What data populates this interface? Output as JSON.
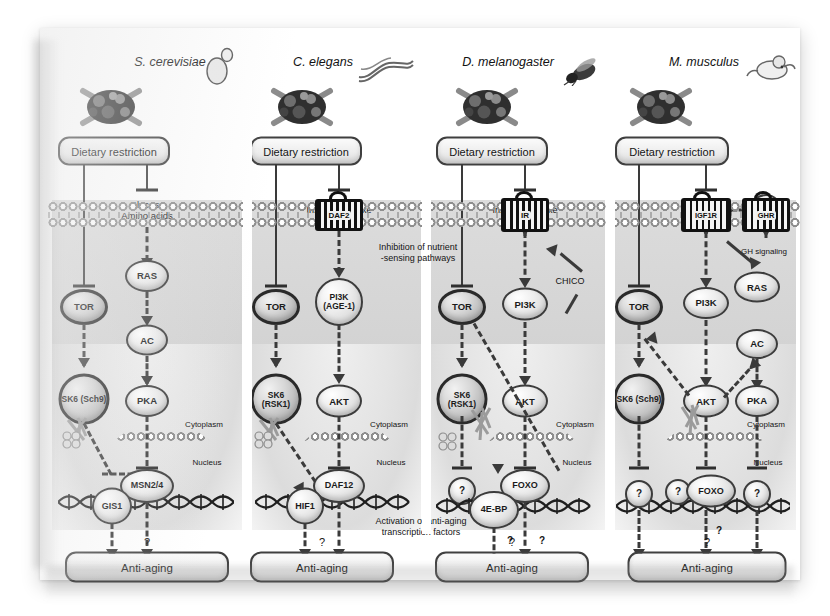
{
  "figure": {
    "cross_panel_annotations": {
      "inhibition_note": "Inhibition of nutrient\n-sensing pathways",
      "activation_note": "Activation of anti-aging\ntranscription factors"
    },
    "compartment_labels": {
      "cytoplasm": "Cytoplasm",
      "nucleus": "Nucleus"
    },
    "question_mark": "?",
    "colors": {
      "node_outline": "#3c3c3c",
      "dark_node_outline": "#2a2a2a",
      "connector": "#3a3a3a",
      "cell_background": "#d6d6d6",
      "paper": "#ffffff"
    }
  },
  "panels": [
    {
      "id": "s-cerevisiae",
      "species": "S. cerevisiae",
      "organism_icon": "yeast-cell-icon",
      "dietary_restriction": "Dietary restriction",
      "ligand_label": "Glucose\nAmino acids",
      "receptor": null,
      "nodes": [
        {
          "name": "TOR",
          "label": "TOR",
          "style": "dark"
        },
        {
          "name": "SK6",
          "label": "SK6\n(Sch9)",
          "style": "dark"
        },
        {
          "name": "RAS",
          "label": "RAS",
          "style": "light"
        },
        {
          "name": "AC",
          "label": "AC",
          "style": "light"
        },
        {
          "name": "PKA",
          "label": "PKA",
          "style": "light"
        },
        {
          "name": "GIS1",
          "label": "GIS1",
          "style": "light"
        },
        {
          "name": "MSN24",
          "label": "MSN2/4",
          "style": "light"
        }
      ],
      "outcome": "Anti-aging",
      "outcome_question": "?"
    },
    {
      "id": "c-elegans",
      "species": "C. elegans",
      "organism_icon": "nematode-worm-icon",
      "dietary_restriction": "Dietary restriction",
      "ligand_label": "Insulin/IGF1-like",
      "receptor": "DAF2",
      "nodes": [
        {
          "name": "TOR",
          "label": "TOR",
          "style": "dark"
        },
        {
          "name": "SK6",
          "label": "SK6\n(RSK1)",
          "style": "dark"
        },
        {
          "name": "PI3K",
          "label": "PI3K\n(AGE-1)",
          "style": "light"
        },
        {
          "name": "AKT",
          "label": "AKT",
          "style": "light"
        },
        {
          "name": "HIF1",
          "label": "HIF1",
          "style": "light"
        },
        {
          "name": "DAF12",
          "label": "DAF12",
          "style": "light"
        }
      ],
      "outcome": "Anti-aging",
      "outcome_question": "?"
    },
    {
      "id": "d-melanogaster",
      "species": "D. melanogaster",
      "organism_icon": "fruit-fly-icon",
      "dietary_restriction": "Dietary restriction",
      "ligand_label": "Insulin/IGF1-like",
      "receptor": "IR",
      "adaptor": "CHICO",
      "nodes": [
        {
          "name": "TOR",
          "label": "TOR",
          "style": "dark"
        },
        {
          "name": "SK6",
          "label": "SK6\n(RSK1)",
          "style": "dark"
        },
        {
          "name": "PI3K",
          "label": "PI3K",
          "style": "light"
        },
        {
          "name": "AKT",
          "label": "AKT",
          "style": "light"
        },
        {
          "name": "UNK1",
          "label": "?",
          "style": "light"
        },
        {
          "name": "4E-BP",
          "label": "4E-BP",
          "style": "light"
        },
        {
          "name": "FOXO",
          "label": "FOXO",
          "style": "light"
        }
      ],
      "outcome": "Anti-aging",
      "outcome_question": "?",
      "branch_questions": [
        "?",
        "?"
      ]
    },
    {
      "id": "m-musculus",
      "species": "M. musculus",
      "organism_icon": "mouse-icon",
      "dietary_restriction": "Dietary restriction",
      "ligand_label": "IGF1",
      "hormone": "GH1",
      "receptor": "IGF1R",
      "receptor2": "GHR",
      "gh_signaling": "GH signaling",
      "nodes": [
        {
          "name": "TOR",
          "label": "TOR",
          "style": "dark"
        },
        {
          "name": "SK6",
          "label": "SK6\n(Sch9)",
          "style": "dark"
        },
        {
          "name": "PI3K",
          "label": "PI3K",
          "style": "light"
        },
        {
          "name": "AKT",
          "label": "AKT",
          "style": "light"
        },
        {
          "name": "RAS",
          "label": "RAS",
          "style": "light"
        },
        {
          "name": "AC",
          "label": "AC",
          "style": "light"
        },
        {
          "name": "PKA",
          "label": "PKA",
          "style": "light"
        },
        {
          "name": "UNK1",
          "label": "?",
          "style": "light"
        },
        {
          "name": "UNK2",
          "label": "?",
          "style": "light"
        },
        {
          "name": "FOXO",
          "label": "FOXO",
          "style": "light"
        },
        {
          "name": "UNK3",
          "label": "?",
          "style": "light"
        }
      ],
      "outcome": "Anti-aging",
      "outcome_question": "?",
      "branch_questions": [
        "?"
      ]
    }
  ]
}
